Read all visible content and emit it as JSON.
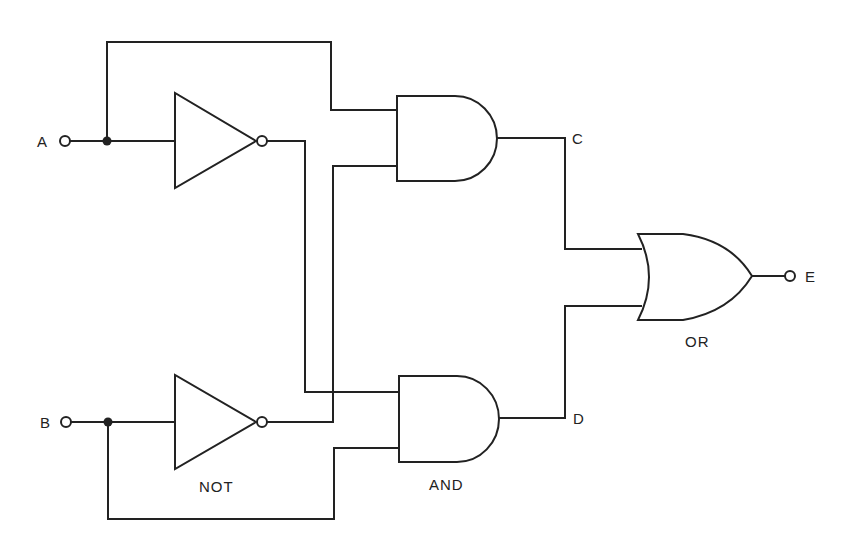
{
  "diagram": {
    "type": "logic-circuit",
    "inputs": [
      {
        "id": "A",
        "label": "A"
      },
      {
        "id": "B",
        "label": "B"
      }
    ],
    "outputs": [
      {
        "id": "E",
        "label": "E"
      }
    ],
    "intermediate": [
      {
        "id": "C",
        "label": "C"
      },
      {
        "id": "D",
        "label": "D"
      }
    ],
    "gate_labels": {
      "not": "NOT",
      "and": "AND",
      "or": "OR"
    },
    "gates": [
      {
        "id": "not1",
        "type": "NOT",
        "input": "A"
      },
      {
        "id": "not2",
        "type": "NOT",
        "input": "B"
      },
      {
        "id": "and1",
        "type": "AND",
        "inputs": [
          "A",
          "NOT B"
        ],
        "output": "C"
      },
      {
        "id": "and2",
        "type": "AND",
        "inputs": [
          "NOT A",
          "B"
        ],
        "output": "D"
      },
      {
        "id": "or1",
        "type": "OR",
        "inputs": [
          "C",
          "D"
        ],
        "output": "E"
      }
    ]
  }
}
